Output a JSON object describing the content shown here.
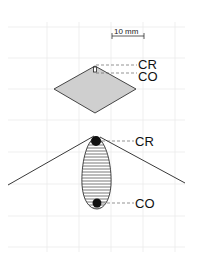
{
  "scale_bar": {
    "label": "10 mm"
  },
  "upper_figure": {
    "labels": {
      "cr": "CR",
      "co": "CO"
    },
    "fill_color": "#cfcfcf"
  },
  "lower_figure": {
    "labels": {
      "cr": "CR",
      "co": "CO"
    }
  },
  "colors": {
    "grid": "#e6e6e6",
    "stroke": "#222222",
    "dot": "#111111"
  }
}
